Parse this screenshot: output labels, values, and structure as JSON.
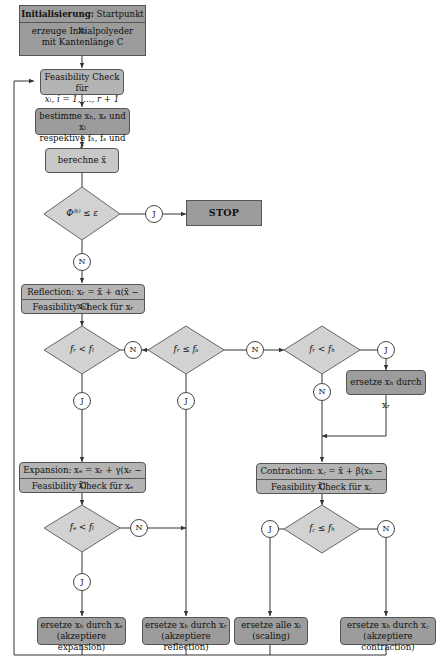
{
  "diagram": {
    "nodes": {
      "init": {
        "title_bold": "Initialisierung:",
        "title_rest": "Startpunkt x₀",
        "line2": "erzeuge Initialpolyeder",
        "line3": "mit Kantenlänge C"
      },
      "feas_all": {
        "line1": "Feasibility Check für",
        "line2": "xᵢ, i = 1, ..., r + 1"
      },
      "determine": {
        "line1": "bestimme xₕ, xₛ und xₗ",
        "line2": "respektive fₕ, fₛ und fₗ"
      },
      "centroid": {
        "label": "berechne x̄"
      },
      "convergence": {
        "label": "Φ⁽ᵏ⁾ ≤ ε"
      },
      "stop": {
        "label": "STOP"
      },
      "reflection": {
        "line1": "Reflection: xᵣ = x̄ + α(x̄ − xₕ)",
        "line2": "Feasibility Check für xᵣ"
      },
      "cond_fr_fl": {
        "label": "fᵣ < fₗ"
      },
      "cond_fr_fs": {
        "label": "fᵣ ≤ fₛ"
      },
      "cond_fr_fh": {
        "label": "fᵣ < fₕ"
      },
      "replace_h_r": {
        "label": "ersetze xₕ durch xᵣ"
      },
      "expansion": {
        "line1": "Expansion: xₑ = xᵣ + γ(xᵣ − x̄)",
        "line2": "Feasibility Check für xₑ"
      },
      "cond_fe_fl": {
        "label": "fₑ < fₗ"
      },
      "contraction": {
        "line1": "Contraction: x꜀ = x̄ + β(xₕ − x̄)",
        "line2": "Feasibility Check für x꜀"
      },
      "cond_fc_fh": {
        "label": "f꜀ ≤ fₕ"
      },
      "accept_expansion": {
        "line1": "ersetze xₕ durch xₑ",
        "line2": "(akzeptiere expansion)"
      },
      "accept_reflection": {
        "line1": "ersetze xₕ durch xᵣ",
        "line2": "(akzeptiere reflection)"
      },
      "scaling": {
        "line1": "ersetze alle xᵢ",
        "line2": "(scaling)"
      },
      "accept_contraction": {
        "line1": "ersetze xₕ durch x꜀",
        "line2": "(akzeptiere contraction)"
      }
    },
    "connectors": {
      "yes": "J",
      "no": "N"
    },
    "colors": {
      "dark_fill": "#9c9c9c",
      "mid_fill": "#b4b4b4",
      "light_fill": "#c8c8c8",
      "stroke": "#555555",
      "line": "#333333"
    }
  }
}
